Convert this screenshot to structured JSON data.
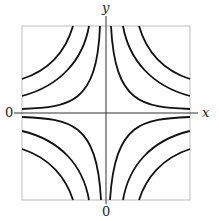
{
  "figure": {
    "type": "contour-plot",
    "axis_labels": {
      "x": "x",
      "y": "y"
    },
    "origin_labels": {
      "left": "0",
      "bottom": "0"
    },
    "colors": {
      "curve": "#111111",
      "axis": "#333333",
      "frame": "#aaaaaa"
    }
  }
}
